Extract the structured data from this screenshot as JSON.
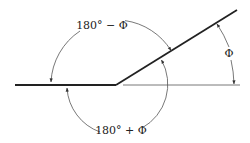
{
  "diagram": {
    "labels": {
      "upper_arc": "180° − Φ",
      "lower_arc": "180° + Φ",
      "right_arc": "Φ"
    },
    "colors": {
      "line": "#222222",
      "thin_line": "#555555",
      "arc": "#555555",
      "background": "#ffffff"
    }
  }
}
